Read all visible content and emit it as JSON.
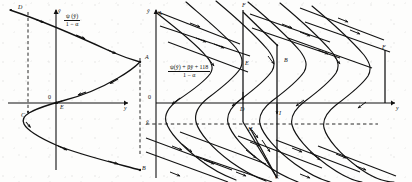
{
  "figure": {
    "panel_count": 2,
    "ink_color": "#111111",
    "background_color": "#fdfdfc"
  },
  "left_panel": {
    "name": "left-phase-plane",
    "formula": {
      "numerator": "ψ (ŷ)",
      "denominator": "1 − α"
    },
    "axes": {
      "y_axis_label": "ŷ",
      "x_axis_label": "y",
      "origin_label": "0"
    },
    "point_labels": [
      {
        "id": "D",
        "text": "D",
        "x": 18,
        "y": 8
      },
      {
        "id": "A",
        "text": "A",
        "x": 146,
        "y": 56
      },
      {
        "id": "E",
        "text": "E",
        "x": 61,
        "y": 98
      },
      {
        "id": "C",
        "text": "C",
        "x": 23,
        "y": 113
      },
      {
        "id": "B",
        "text": "B",
        "x": 142,
        "y": 158
      }
    ],
    "curve_description": "single S-shaped (sigmoid-fold) characteristic curve with directional arrowheads",
    "dashed_guides": 2,
    "arrow_count": 8
  },
  "right_panel": {
    "name": "right-phase-plane",
    "formula": {
      "numerator": "ψ(ŷ) + βŷ + 118",
      "denominator": "1 − α"
    },
    "axes": {
      "y_axis_label": "ŷ",
      "x_axis_label": "y",
      "origin_label": "0",
      "dashed_level_label": "ŷ"
    },
    "point_labels": [
      {
        "id": "A",
        "text": "A",
        "x": 154,
        "y": 14
      },
      {
        "id": "F",
        "text": "F",
        "x": 243,
        "y": 5
      },
      {
        "id": "E",
        "text": "E",
        "x": 247,
        "y": 65
      },
      {
        "id": "B",
        "text": "B",
        "x": 285,
        "y": 61
      },
      {
        "id": "Fp",
        "text": "F",
        "x": 381,
        "y": 48
      },
      {
        "id": "D",
        "text": "D",
        "x": 242,
        "y": 110
      },
      {
        "id": "H",
        "text": "H",
        "x": 248,
        "y": 127
      },
      {
        "id": "I",
        "text": "I",
        "x": 277,
        "y": 113
      },
      {
        "id": "C",
        "text": "C",
        "x": 277,
        "y": 176
      }
    ],
    "curve_count": 6,
    "curve_description": "family of six S-shaped (folded) trajectories, periodic in ŷ, crossed by straight inflow lines with arrowheads",
    "dashed_guides": 1,
    "arrow_count": 28
  }
}
